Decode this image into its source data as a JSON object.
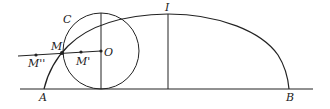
{
  "diagram": {
    "labels": {
      "A": "A",
      "B": "B",
      "C": "C",
      "I": "I",
      "M": "M",
      "M1": "M'",
      "M2": "M''",
      "O": "O"
    },
    "colors": {
      "stroke": "#222222",
      "background": "#ffffff"
    }
  }
}
